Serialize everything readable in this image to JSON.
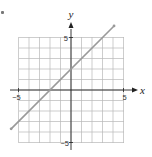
{
  "chart_data": {
    "type": "line",
    "title": "",
    "xlabel": "x",
    "ylabel": "y",
    "xlim": [
      -5,
      5
    ],
    "ylim": [
      -5,
      5
    ],
    "grid": true,
    "legend": null,
    "x_ticks_labeled": [
      -5,
      5
    ],
    "y_ticks_labeled": [
      -5,
      5
    ],
    "tick_labels": {
      "x_min": "−5",
      "x_max": "5",
      "y_min": "−5",
      "y_max": "5"
    },
    "series": [
      {
        "name": "y = x + 2",
        "equation": "y = x + 2",
        "slope": 1,
        "intercept": 2,
        "x": [
          -5.7,
          4.1
        ],
        "y": [
          -3.7,
          6.1
        ],
        "x_intercept": -2,
        "y_intercept": 2
      }
    ],
    "colors": {
      "line": "#9a9a9a",
      "grid": "#b8b8b8",
      "axis": "#222222"
    }
  }
}
